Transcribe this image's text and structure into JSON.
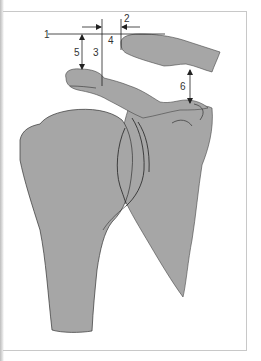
{
  "figure": {
    "fill_color": "#a6a6a6",
    "stroke_color": "#333333",
    "labels": [
      {
        "id": "1",
        "text": "1"
      },
      {
        "id": "2",
        "text": "2"
      },
      {
        "id": "3",
        "text": "3"
      },
      {
        "id": "4",
        "text": "4"
      },
      {
        "id": "5",
        "text": "5"
      },
      {
        "id": "6",
        "text": "6"
      }
    ]
  }
}
